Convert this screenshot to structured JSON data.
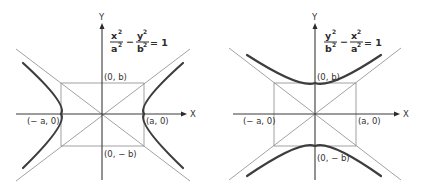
{
  "figures": [
    {
      "name": "horizontal-hyperbola",
      "equation": {
        "term1_num": "x",
        "term1_den": "a",
        "term2_num": "y",
        "term2_den": "b",
        "sup": "2",
        "minus": "−",
        "equals": "= 1"
      },
      "axis_labels": {
        "x": "X",
        "y": "Y"
      },
      "points": {
        "top": "(0, b)",
        "bottom": "(0, − b)",
        "left": "(− a, 0)",
        "right": "(a, 0)"
      }
    },
    {
      "name": "vertical-hyperbola",
      "equation": {
        "term1_num": "y",
        "term1_den": "b",
        "term2_num": "x",
        "term2_den": "a",
        "sup": "2",
        "minus": "−",
        "equals": "= 1"
      },
      "axis_labels": {
        "x": "X",
        "y": "Y"
      },
      "points": {
        "top": "(0, b)",
        "bottom": "(0, − b)",
        "left": "(− a, 0)",
        "right": "(a, 0)"
      }
    }
  ],
  "colors": {
    "axis": "#3a3a3a",
    "guide": "#8a8a8a",
    "curve": "#3d3d3d"
  }
}
